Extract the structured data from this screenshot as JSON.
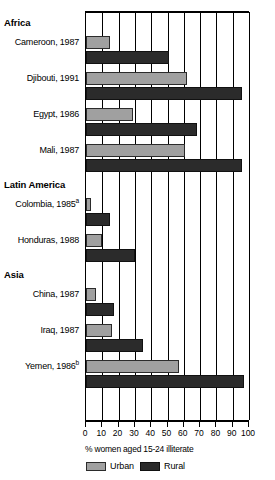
{
  "chart_data": {
    "type": "bar",
    "orientation": "horizontal",
    "title": "",
    "xlabel": "% women aged 15-24 illiterate",
    "ylabel": "",
    "xlim": [
      0,
      100
    ],
    "xticks": [
      0,
      10,
      20,
      30,
      40,
      50,
      60,
      70,
      80,
      90,
      100
    ],
    "xtick_labels": [
      "0",
      "10",
      "20",
      "30",
      "40",
      "50",
      "60",
      "70",
      "80",
      "90",
      "100"
    ],
    "grid": "vertical",
    "legend_position": "bottom",
    "series": [
      {
        "name": "Urban",
        "color": "#a0a0a0",
        "values": [
          15,
          62,
          29,
          61,
          3,
          10,
          6,
          16,
          57
        ]
      },
      {
        "name": "Rural",
        "color": "#2b2b2b",
        "values": [
          51,
          96,
          68,
          96,
          15,
          30,
          17,
          35,
          97
        ]
      }
    ],
    "categories": [
      "Cameroon, 1987",
      "Djibouti, 1991",
      "Egypt, 1986",
      "Mali, 1987",
      "Colombia, 1985a",
      "Honduras, 1988",
      "China, 1987",
      "Iraq, 1987",
      "Yemen, 1986b"
    ],
    "groups": [
      {
        "title": "Africa",
        "rows": [
          {
            "label": "Cameroon, 1987",
            "note": "",
            "urban": 15,
            "rural": 51
          },
          {
            "label": "Djibouti, 1991",
            "note": "",
            "urban": 62,
            "rural": 96
          },
          {
            "label": "Egypt, 1986",
            "note": "",
            "urban": 29,
            "rural": 68
          },
          {
            "label": "Mali, 1987",
            "note": "",
            "urban": 61,
            "rural": 96
          }
        ]
      },
      {
        "title": "Latin America",
        "rows": [
          {
            "label": "Colombia, 1985",
            "note": "a",
            "urban": 3,
            "rural": 15
          },
          {
            "label": "Honduras, 1988",
            "note": "",
            "urban": 10,
            "rural": 30
          }
        ]
      },
      {
        "title": "Asia",
        "rows": [
          {
            "label": "China, 1987",
            "note": "",
            "urban": 6,
            "rural": 17
          },
          {
            "label": "Iraq, 1987",
            "note": "",
            "urban": 16,
            "rural": 35
          },
          {
            "label": "Yemen, 1986",
            "note": "b",
            "urban": 57,
            "rural": 97
          }
        ]
      }
    ],
    "legend": [
      {
        "label": "Urban",
        "color": "#a0a0a0"
      },
      {
        "label": "Rural",
        "color": "#2b2b2b"
      }
    ]
  }
}
